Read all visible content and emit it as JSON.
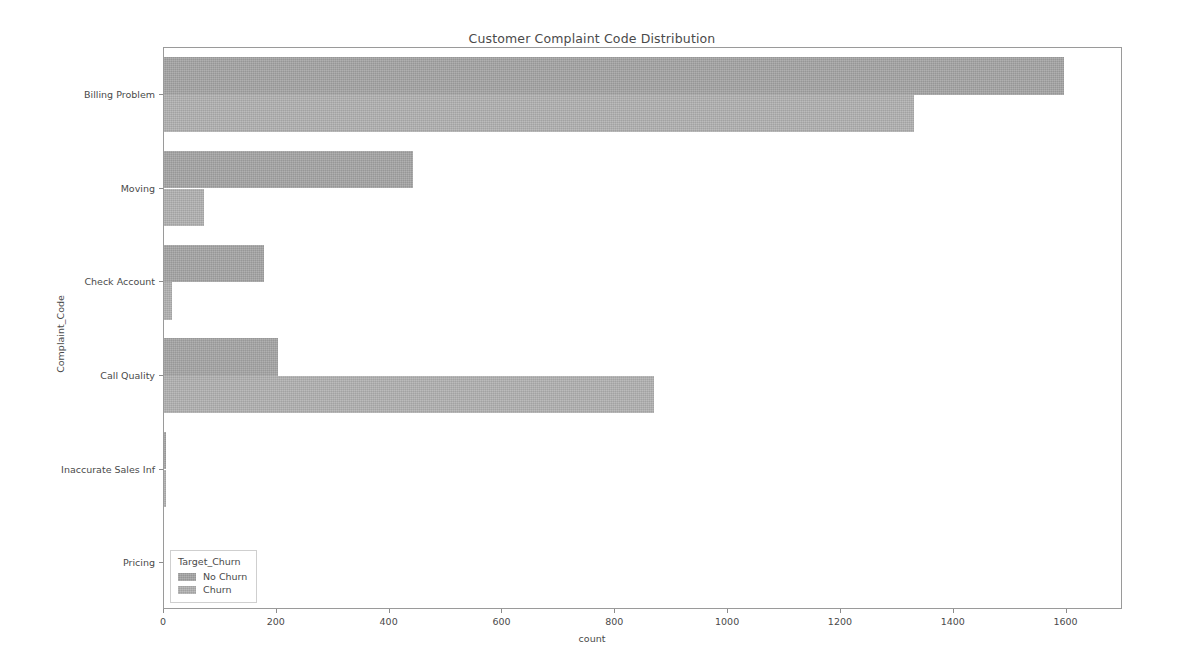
{
  "chart_data": {
    "type": "bar",
    "orientation": "horizontal",
    "title": "Customer Complaint Code Distribution",
    "xlabel": "count",
    "ylabel": "Complaint_Code",
    "categories": [
      "Billing Problem",
      "Moving",
      "Check Account",
      "Call Quality",
      "Inaccurate Sales Inf",
      "Pricing"
    ],
    "series": [
      {
        "name": "No Churn",
        "color": "#a8a8a8",
        "values": [
          1595,
          442,
          177,
          202,
          4,
          0
        ]
      },
      {
        "name": "Churn",
        "color": "#b4b4b4",
        "values": [
          1329,
          71,
          15,
          868,
          3,
          0
        ]
      }
    ],
    "xlim": [
      0,
      1700
    ],
    "xticks": [
      0,
      200,
      400,
      600,
      800,
      1000,
      1200,
      1400,
      1600
    ],
    "xtick_labels": [
      "0",
      "200",
      "400",
      "600",
      "800",
      "1000",
      "1200",
      "1400",
      "1600"
    ],
    "grid": false,
    "legend": {
      "title": "Target_Churn",
      "position": "lower left",
      "entries": [
        "No Churn",
        "Churn"
      ]
    }
  }
}
